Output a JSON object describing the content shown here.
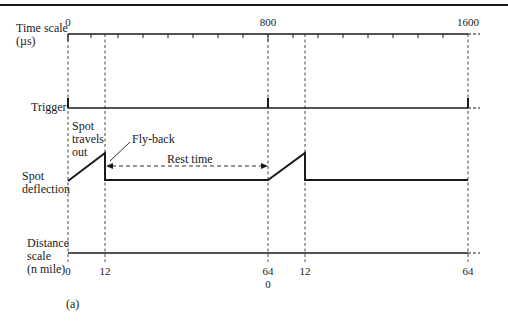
{
  "diagram": {
    "caption": "(a)",
    "rows": {
      "time_scale": {
        "label_line1": "Time scale",
        "label_line2": "(µs)",
        "ticks": [
          "0",
          "800",
          "1600"
        ]
      },
      "trigger": {
        "label": "Trigger"
      },
      "spot_deflection": {
        "label_line1": "Spot",
        "label_line2": "deflection"
      },
      "distance_scale": {
        "label_line1": "Distance",
        "label_line2": "scale",
        "label_line3": "(n mile)",
        "ticks": [
          "0",
          "12",
          "64",
          "0",
          "12",
          "64"
        ]
      }
    },
    "annotations": {
      "spot_travels_out": [
        "Spot",
        "travels",
        "out"
      ],
      "fly_back": "Fly-back",
      "rest_time": "Rest time"
    }
  }
}
